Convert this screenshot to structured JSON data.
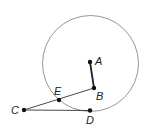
{
  "diagram": {
    "type": "geometry",
    "circle": {
      "cx": 90.5,
      "cy": 63.5,
      "r": 48,
      "stroke": "#8a8a8a"
    },
    "points": {
      "A": {
        "label": "A",
        "x": 90,
        "y": 62
      },
      "B": {
        "label": "B",
        "x": 94,
        "y": 88
      },
      "C": {
        "label": "C",
        "x": 24,
        "y": 110
      },
      "D": {
        "label": "D",
        "x": 90,
        "y": 110.5
      },
      "E": {
        "label": "E",
        "x": 59,
        "y": 100
      }
    },
    "segments": [
      {
        "from": "A",
        "to": "B",
        "style": "bold"
      },
      {
        "from": "C",
        "to": "B",
        "style": "thin"
      },
      {
        "from": "C",
        "to": "D",
        "style": "thin"
      }
    ],
    "colors": {
      "line": "#333333",
      "point": "#111111",
      "circle": "#8a8a8a"
    }
  }
}
